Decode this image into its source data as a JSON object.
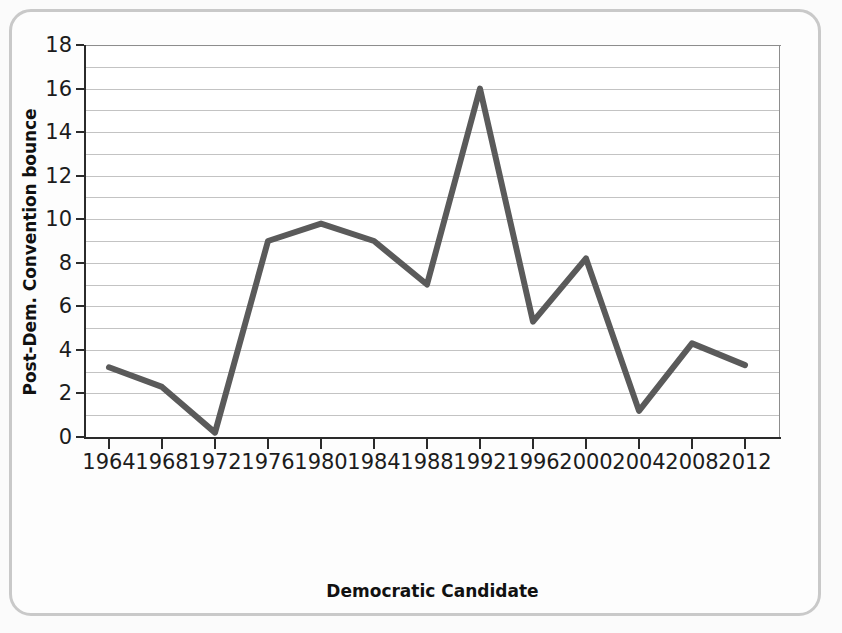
{
  "chart_data": {
    "type": "line",
    "title": "",
    "xlabel": "Democratic Candidate",
    "ylabel": "Post-Dem. Convention bounce",
    "ylim": [
      0,
      18
    ],
    "ytick_step": 2,
    "yticks": [
      0,
      2,
      4,
      6,
      8,
      10,
      12,
      14,
      16,
      18
    ],
    "grid": "horizontal gridlines at every integer value",
    "legend": "none",
    "line_color": "#5a5a5a",
    "line_width": 6,
    "categories": [
      "1964",
      "1968",
      "1972",
      "1976",
      "1980",
      "1984",
      "1988",
      "1992",
      "1996",
      "2000",
      "2004",
      "2008",
      "2012"
    ],
    "candidates": [
      "Johnson",
      "Humphrey",
      "McGovern",
      "Carter",
      "Carter",
      "Mondale",
      "Dukakis",
      "Clinton",
      "Clinton",
      "Gore",
      "Kerry",
      "Obama",
      "Obama"
    ],
    "values": [
      3.2,
      2.3,
      0.2,
      9.0,
      9.8,
      9.0,
      7.0,
      16.0,
      5.3,
      8.2,
      1.2,
      4.3,
      3.3
    ]
  },
  "figure": {
    "background_color": "#fbfbfb",
    "frame_color": "#c9c9c9",
    "axis_color": "#2b2b2b",
    "grid_color": "#c3c3c3"
  }
}
